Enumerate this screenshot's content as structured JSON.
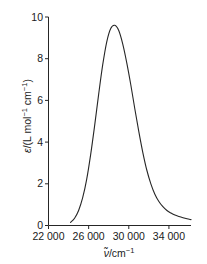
{
  "chart_data": {
    "type": "line",
    "title": "",
    "xlabel": "ν̃/cm⁻¹",
    "ylabel": "ε/(L mol⁻¹ cm⁻¹)",
    "xlim": [
      22000,
      36200
    ],
    "ylim": [
      0,
      10
    ],
    "grid": false,
    "legend": null,
    "xticks": [
      22000,
      26000,
      30000,
      34000
    ],
    "xtick_labels": [
      "22 000",
      "26 000",
      "30 000",
      "34 000"
    ],
    "yticks": [
      0,
      2,
      4,
      6,
      8,
      10
    ],
    "ytick_labels": [
      "0",
      "2",
      "4",
      "6",
      "8",
      "10"
    ],
    "line_color": "#262626",
    "line_width": 1.1,
    "series": [
      {
        "name": "absorption band",
        "x": [
          24200,
          24600,
          25000,
          25400,
          25800,
          26200,
          26600,
          27000,
          27400,
          27800,
          28200,
          28600,
          29000,
          29400,
          29800,
          30200,
          30600,
          31000,
          31400,
          31800,
          32200,
          32600,
          33000,
          33400,
          33800,
          34200,
          34600,
          35000,
          35400,
          35800,
          36200
        ],
        "y": [
          0.15,
          0.35,
          0.72,
          1.32,
          2.2,
          3.4,
          4.8,
          6.3,
          7.7,
          8.8,
          9.45,
          9.6,
          9.35,
          8.7,
          7.8,
          6.75,
          5.6,
          4.5,
          3.5,
          2.65,
          2.0,
          1.5,
          1.15,
          0.9,
          0.72,
          0.6,
          0.5,
          0.43,
          0.37,
          0.32,
          0.28
        ]
      }
    ],
    "peak": {
      "x": 28600,
      "y": 9.6
    }
  },
  "axis": {
    "y_title_parts": {
      "epsilon": "ε",
      "rest": "/(L mol",
      "sup1": "−1",
      "mid": " cm",
      "sup2": "−1",
      "close": ")"
    },
    "x_title_parts": {
      "nu": "ν̃",
      "rest": "/cm",
      "sup": "−1"
    }
  }
}
